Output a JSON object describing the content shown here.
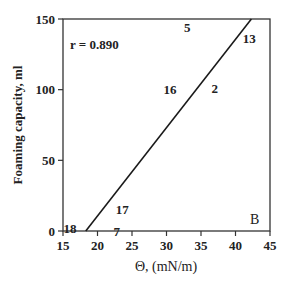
{
  "chart_data": {
    "type": "scatter",
    "title": "",
    "xlabel": "Θ,  (mN/m)",
    "ylabel": "Foaming capacity, ml",
    "xlim": [
      15,
      45
    ],
    "ylim": [
      0,
      150
    ],
    "xticks": [
      15,
      20,
      25,
      30,
      35,
      40,
      45
    ],
    "yticks": [
      0,
      50,
      100,
      150
    ],
    "grid": false,
    "legend": null,
    "annotation": "r = 0.890",
    "panel_label": "B",
    "points": [
      {
        "label": "5",
        "x": 33.0,
        "y": 144
      },
      {
        "label": "13",
        "x": 42.0,
        "y": 136
      },
      {
        "label": "16",
        "x": 30.5,
        "y": 100
      },
      {
        "label": "2",
        "x": 37.0,
        "y": 101
      },
      {
        "label": "17",
        "x": 23.6,
        "y": 15
      },
      {
        "label": "18",
        "x": 16.0,
        "y": 2
      },
      {
        "label": "7",
        "x": 22.8,
        "y": 0
      }
    ],
    "fit_line": {
      "x": [
        18.3,
        42.3
      ],
      "y": [
        0,
        150
      ]
    }
  },
  "labels": {
    "annotation": "r = 0.890",
    "panel": "B",
    "xlabel": "Θ,  (mN/m)",
    "ylabel": "Foaming capacity, ml"
  }
}
